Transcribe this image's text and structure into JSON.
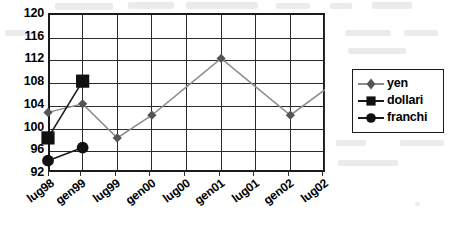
{
  "chart_data": {
    "type": "line",
    "title": "",
    "xlabel": "",
    "ylabel": "",
    "categories": [
      "lug98",
      "gen99",
      "lug99",
      "gen00",
      "lug00",
      "gen01",
      "lug01",
      "gen02",
      "lug02"
    ],
    "ylim": [
      92,
      120
    ],
    "yticks": [
      92,
      96,
      100,
      104,
      108,
      112,
      116,
      120
    ],
    "grid": true,
    "legend_position": "right",
    "series": [
      {
        "name": "yen",
        "marker": "diamond",
        "color": "#8c8c8c",
        "values": [
          102.5,
          104,
          98,
          102,
          107,
          112,
          107,
          102,
          106.5
        ],
        "marker_points": [
          {
            "category": "lug98",
            "value": 102.5
          },
          {
            "category": "gen99",
            "value": 104
          },
          {
            "category": "lug99",
            "value": 98
          },
          {
            "category": "gen00",
            "value": 102
          },
          {
            "category": "gen01",
            "value": 112
          },
          {
            "category": "gen02",
            "value": 102
          }
        ]
      },
      {
        "name": "dollari",
        "marker": "square",
        "color": "#1a1a1a",
        "values": [
          98,
          108,
          null,
          null,
          null,
          null,
          null,
          null,
          null
        ],
        "marker_points": [
          {
            "category": "lug98",
            "value": 98
          },
          {
            "category": "gen99",
            "value": 108
          }
        ]
      },
      {
        "name": "franchi",
        "marker": "circle",
        "color": "#1a1a1a",
        "values": [
          94,
          96.3,
          null,
          null,
          null,
          null,
          null,
          null,
          null
        ],
        "marker_points": [
          {
            "category": "lug98",
            "value": 94
          },
          {
            "category": "gen99",
            "value": 96.3
          }
        ]
      }
    ]
  },
  "legend": {
    "entries": [
      {
        "label": "yen",
        "marker": "diamond",
        "color": "#8c8c8c"
      },
      {
        "label": "dollari",
        "marker": "square",
        "color": "#1a1a1a"
      },
      {
        "label": "franchi",
        "marker": "circle",
        "color": "#1a1a1a"
      }
    ]
  },
  "axes": {
    "y_labels": [
      "120",
      "116",
      "112",
      "108",
      "104",
      "100",
      "96",
      "92"
    ],
    "x_labels": [
      "lug98",
      "gen99",
      "lug99",
      "gen00",
      "lug00",
      "gen01",
      "lug01",
      "gen02",
      "lug02"
    ]
  }
}
